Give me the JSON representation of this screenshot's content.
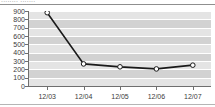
{
  "header": {
    "clipped_title": "........ ......."
  },
  "chart_data": {
    "type": "line",
    "title": "",
    "xlabel": "",
    "ylabel": "",
    "categories": [
      "12/03",
      "12/04",
      "12/05",
      "12/06",
      "12/07"
    ],
    "values": [
      880,
      265,
      230,
      205,
      250
    ],
    "ylim": [
      0,
      900
    ],
    "yticks": [
      900,
      800,
      700,
      600,
      500,
      400,
      300,
      200,
      100,
      0
    ],
    "ytick_labels": [
      "900",
      "800",
      "700",
      "600",
      "500",
      "400",
      "300",
      "200",
      "100",
      "0"
    ],
    "grid": true,
    "grid_style": "horizontal-banded",
    "legend": false,
    "legend_position": "none",
    "series": [
      {
        "name": "series-1",
        "values": [
          880,
          265,
          230,
          205,
          250
        ],
        "line_color": "#1a1a1a",
        "marker": "circle-open",
        "marker_face_color": "#ffffff",
        "marker_edge_color": "#1a1a1a"
      }
    ],
    "colors": {
      "plot_background": "#ffffff",
      "band_color": "#d2d2d2",
      "gridline_color": "#ffffff",
      "axis_color": "#6f6f6f",
      "tick_label_color": "#3b3b3b",
      "line_color": "#1a1a1a"
    }
  }
}
